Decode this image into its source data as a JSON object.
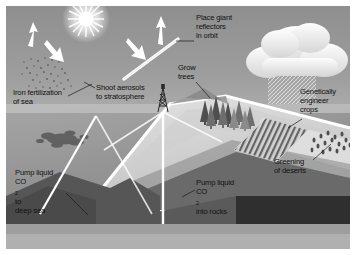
{
  "figure": {
    "type": "geoengineering-schematic",
    "style": "grayscale-illustration"
  },
  "labels": [
    {
      "id": "iron-fertilization",
      "lines": [
        "Iron fertilization",
        "of sea"
      ],
      "x": 13,
      "y": 88,
      "leader": {
        "x1": 66,
        "y1": 96,
        "x2": 90,
        "y2": 84
      }
    },
    {
      "id": "shoot-aerosols",
      "lines": [
        "Shoot aerosols",
        "to stratosphere"
      ],
      "x": 96,
      "y": 83,
      "leader": {
        "x1": 95,
        "y1": 87,
        "x2": 84,
        "y2": 81
      }
    },
    {
      "id": "place-reflectors",
      "lines": [
        "Place giant",
        "reflectors",
        "in orbit"
      ],
      "x": 196,
      "y": 13,
      "leader": {
        "x1": 195,
        "y1": 40,
        "x2": 176,
        "y2": 40
      }
    },
    {
      "id": "grow-trees",
      "lines": [
        "Grow",
        "trees"
      ],
      "x": 178,
      "y": 63,
      "leader": {
        "x1": 196,
        "y1": 80,
        "x2": 210,
        "y2": 96
      }
    },
    {
      "id": "genetically-engineer-crops",
      "lines": [
        "Genetically",
        "engineer",
        "crops"
      ],
      "x": 300,
      "y": 87,
      "leader": {
        "x1": 303,
        "y1": 118,
        "x2": 288,
        "y2": 127
      }
    },
    {
      "id": "greening-of-deserts",
      "lines": [
        "Greening",
        "of deserts"
      ],
      "x": 274,
      "y": 157,
      "leader": {
        "x1": 312,
        "y1": 160,
        "x2": 330,
        "y2": 145
      }
    },
    {
      "id": "pump-co2-deep-sea",
      "lines": [
        "Pump liquid",
        "CO2 to",
        "deep sea"
      ],
      "x": 15,
      "y": 168,
      "leader": {
        "x1": 66,
        "y1": 192,
        "x2": 86,
        "y2": 214
      }
    },
    {
      "id": "pump-co2-into-rocks",
      "lines": [
        "Pump liquid",
        "CO2 into rocks"
      ],
      "x": 196,
      "y": 178,
      "leader": {
        "x1": 194,
        "y1": 190,
        "x2": 182,
        "y2": 196
      }
    }
  ],
  "label_text": {
    "iron_1": "Iron fertilization",
    "iron_2": "of sea",
    "aero_1": "Shoot aerosols",
    "aero_2": "to stratosphere",
    "place_1": "Place giant",
    "place_2": "reflectors",
    "place_3": "in orbit",
    "grow_1": "Grow",
    "grow_2": "trees",
    "gen_1": "Genetically",
    "gen_2": "engineer",
    "gen_3": "crops",
    "green_1": "Greening",
    "green_2": "of deserts",
    "deep_1": "Pump liquid",
    "deep_2_pre": "CO",
    "deep_2_sub": "2",
    "deep_2_post": " to",
    "deep_3": "deep sea",
    "rocks_1": "Pump liquid",
    "rocks_2_pre": "CO",
    "rocks_2_sub": "2",
    "rocks_2_post": " into rocks"
  },
  "scene_elements": [
    {
      "id": "sun",
      "name": "sun",
      "x": 86,
      "y": 19,
      "radius": 9
    },
    {
      "id": "arrow-up-left",
      "name": "upward-radiation-arrow",
      "x": 30,
      "y": 28
    },
    {
      "id": "arrow-down-left",
      "name": "downward-aerosol-arrow",
      "x": 57,
      "y": 57
    },
    {
      "id": "arrow-down-mid",
      "name": "downward-reflected-arrow",
      "x": 140,
      "y": 48
    },
    {
      "id": "arrow-up-right",
      "name": "upward-radiation-arrow-right",
      "x": 160,
      "y": 20
    },
    {
      "id": "reflector-bar",
      "name": "orbital-reflector",
      "x1": 127,
      "y1": 76,
      "x2": 176,
      "y2": 40
    },
    {
      "id": "cloud",
      "name": "rain-cloud",
      "x": 296,
      "y": 50
    },
    {
      "id": "rain",
      "name": "rainfall-hatch",
      "x": 268,
      "y": 73
    },
    {
      "id": "derrick",
      "name": "drilling-derrick",
      "x": 163,
      "y": 94
    },
    {
      "id": "trees",
      "name": "forest-stand",
      "x": 225,
      "y": 100
    },
    {
      "id": "crop-field",
      "name": "crop-field-rows",
      "x": 255,
      "y": 130
    },
    {
      "id": "desert-shrubs",
      "name": "desert-vegetation-dots",
      "x": 330,
      "y": 142
    },
    {
      "id": "algae-bloom",
      "name": "algae-bloom-patch",
      "x": 63,
      "y": 140
    },
    {
      "id": "iron-dots",
      "name": "iron-particle-dots",
      "x": 52,
      "y": 70
    },
    {
      "id": "pipeline",
      "name": "co2-pipeline",
      "x": 165,
      "y": 120
    },
    {
      "id": "ocean",
      "name": "ocean-surface",
      "x": 0,
      "y": 110
    },
    {
      "id": "seabed",
      "name": "deep-sea-floor",
      "x": 0,
      "y": 190
    },
    {
      "id": "rock-strata",
      "name": "subsurface-rock-strata",
      "x": 180,
      "y": 195
    }
  ],
  "colors": {
    "sky": "#9a9a9a",
    "sky_light": "#c9c9c9",
    "ocean": "#8e8e8e",
    "ocean_deep": "#6e6e6e",
    "land_light": "#d8d8d8",
    "land_mid": "#b4b4b4",
    "rock_dark": "#4a4a4a",
    "rock_darkest": "#2e2e2e",
    "cloud": "#f2f2f2",
    "sun": "#ffffff",
    "label_text": "#111111",
    "frame": "#ffffff"
  }
}
